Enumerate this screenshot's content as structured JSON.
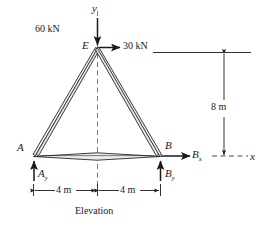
{
  "figure": {
    "caption": "Elevation",
    "axes": {
      "y_label": "y",
      "x_label": "x"
    },
    "joints": [
      {
        "name": "E",
        "label": "E"
      },
      {
        "name": "A",
        "label": "A"
      },
      {
        "name": "B",
        "label": "B"
      }
    ],
    "loads": [
      {
        "name": "vertical-load",
        "label": "60 kN",
        "direction": "down"
      },
      {
        "name": "horizontal-load",
        "label": "30 kN",
        "direction": "right"
      }
    ],
    "reactions": [
      {
        "name": "reaction-ay",
        "label": "A",
        "subscript": "y",
        "direction": "up"
      },
      {
        "name": "reaction-by",
        "label": "B",
        "subscript": "y",
        "direction": "up"
      },
      {
        "name": "reaction-bx",
        "label": "B",
        "subscript": "x",
        "direction": "right"
      }
    ],
    "dimensions": [
      {
        "name": "height-dimension",
        "label": "8 m",
        "orientation": "vertical"
      },
      {
        "name": "span-left-dimension",
        "label": "4 m",
        "orientation": "horizontal"
      },
      {
        "name": "span-right-dimension",
        "label": "4 m",
        "orientation": "horizontal"
      }
    ],
    "colors": {
      "line": "#1a1a1a",
      "member_fill": "#e8e8e8",
      "dashed": "#6a6a6a",
      "background": "#ffffff"
    }
  }
}
